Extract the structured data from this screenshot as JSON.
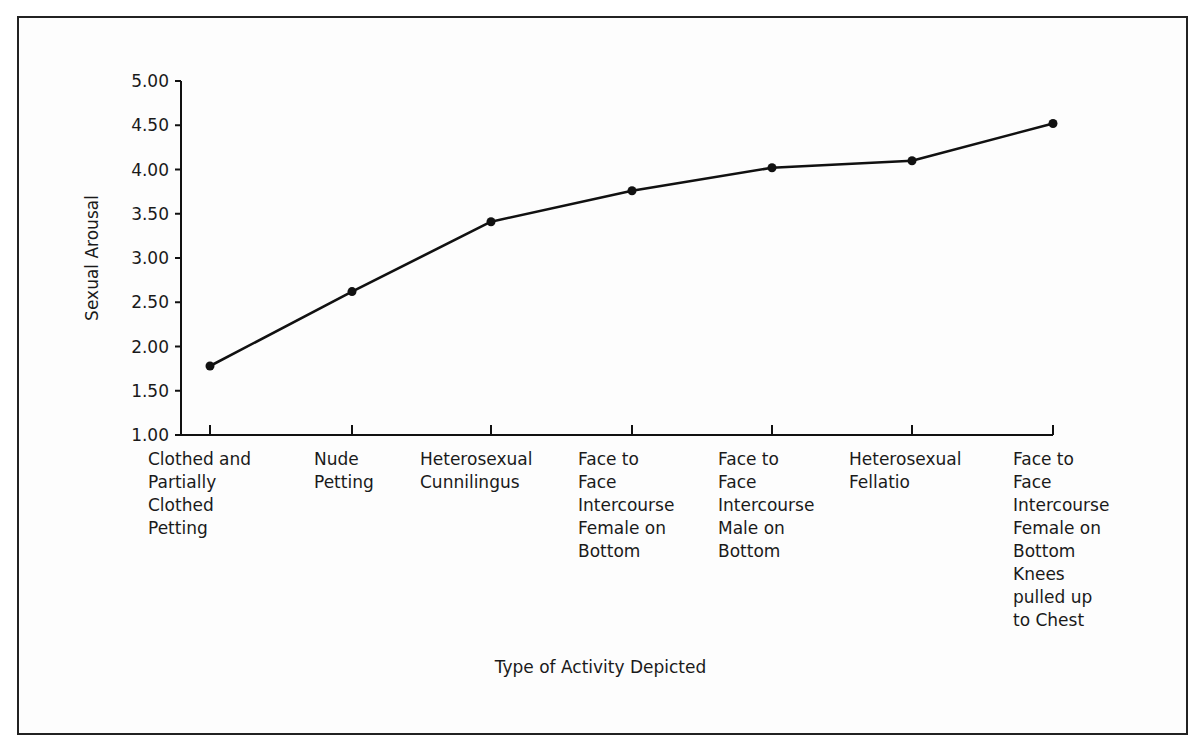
{
  "chart_data": {
    "type": "line",
    "title": "",
    "xlabel": "Type of Activity Depicted",
    "ylabel": "Sexual Arousal",
    "ylim": [
      1.0,
      5.0
    ],
    "yticks": [
      "1.00",
      "1.50",
      "2.00",
      "2.50",
      "3.00",
      "3.50",
      "4.00",
      "4.50",
      "5.00"
    ],
    "grid": false,
    "legend": null,
    "categories": [
      "Clothed and Partially Clothed Petting",
      "Nude Petting",
      "Heterosexual Cunnilingus",
      "Face to Face Intercourse Female on Bottom",
      "Face to Face Intercourse Male on Bottom",
      "Heterosexual Fellatio",
      "Face to Face Intercourse Female on Bottom Knees pulled up to Chest"
    ],
    "category_lines": [
      [
        "Clothed and",
        "Partially",
        "Clothed",
        "Petting"
      ],
      [
        "Nude",
        "Petting"
      ],
      [
        "Heterosexual",
        "Cunnilingus"
      ],
      [
        "Face to",
        "Face",
        "Intercourse",
        "Female on",
        "Bottom"
      ],
      [
        "Face to",
        "Face",
        "Intercourse",
        "Male on",
        "Bottom"
      ],
      [
        "Heterosexual",
        "Fellatio"
      ],
      [
        "Face to",
        "Face",
        "Intercourse",
        "Female on",
        "Bottom",
        "Knees",
        "pulled up",
        "to Chest"
      ]
    ],
    "series": [
      {
        "name": "Sexual Arousal",
        "values": [
          1.78,
          2.62,
          3.41,
          3.76,
          4.02,
          4.1,
          4.52
        ]
      }
    ]
  },
  "labels": {
    "ylabel": "Sexual Arousal",
    "xlabel": "Type of Activity Depicted",
    "cat0": "Clothed and\nPartially\nClothed\nPetting",
    "cat1": "Nude\nPetting",
    "cat2": "Heterosexual\nCunnilingus",
    "cat3": "Face to\nFace\nIntercourse\nFemale on\nBottom",
    "cat4": "Face to\nFace\nIntercourse\nMale on\nBottom",
    "cat5": "Heterosexual\nFellatio",
    "cat6": "Face to\nFace\nIntercourse\nFemale on\nBottom\nKnees\npulled up\nto Chest"
  }
}
